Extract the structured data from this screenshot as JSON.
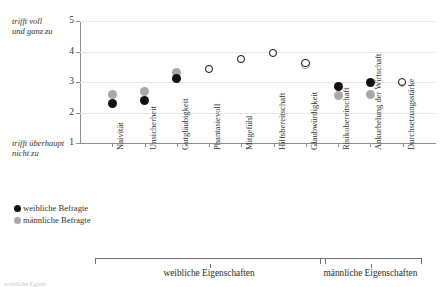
{
  "axis_labels": {
    "top_left_line1": "trifft voll",
    "top_left_line2": "und ganz zu",
    "bottom_left_line1": "trifft überhaupt",
    "bottom_left_line2": "nicht zu"
  },
  "legend": {
    "female_label": "weibliche Befragte",
    "male_label": "männliche Befragte",
    "female_color": "#111111",
    "male_color": "#a8a8a8"
  },
  "groups": [
    {
      "label": "weibliche Eigenschaften",
      "start_index": 0,
      "end_index": 6
    },
    {
      "label": "männliche Eigenschaften",
      "start_index": 7,
      "end_index": 9
    }
  ],
  "caption": "weibliche Eigens",
  "chart_data": {
    "type": "scatter",
    "title": "",
    "xlabel": "",
    "ylabel": "",
    "ylim": [
      1,
      5
    ],
    "yticks": [
      1,
      2,
      3,
      4,
      5
    ],
    "ytick_labels": [
      "1",
      "2",
      "3",
      "4",
      "5"
    ],
    "grid": true,
    "legend_position": "below-left",
    "categories": [
      "Naivität",
      "Unsicherheit",
      "Gutgläubigkeit",
      "Phantasievoll",
      "Mitgefühl",
      "Hilfsbereitschaft",
      "Glaubwürdigkeit",
      "Risikobereitschaft",
      "Ankurbelung der Wirtschaft",
      "Durchsetzungsstärke"
    ],
    "series": [
      {
        "name": "weibliche Befragte",
        "color": "#111111",
        "values": [
          2.3,
          2.4,
          3.1,
          3.4,
          3.75,
          3.95,
          3.6,
          2.85,
          3.0,
          3.0
        ]
      },
      {
        "name": "männliche Befragte",
        "color": "#a8a8a8",
        "values": [
          2.6,
          2.7,
          3.3,
          3.4,
          3.75,
          3.95,
          3.55,
          2.55,
          2.6,
          2.95
        ]
      }
    ]
  }
}
